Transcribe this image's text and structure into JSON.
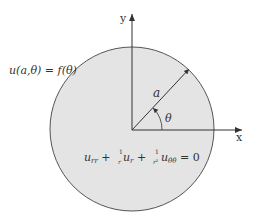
{
  "diagram": {
    "boundary_condition": "u(a,θ) = f(θ)",
    "equation": {
      "t1": "u",
      "t1_sub": "rr",
      "plus1": " + ",
      "frac1_num": "1",
      "frac1_den": "r",
      "t2": "u",
      "t2_sub": "r",
      "plus2": " + ",
      "frac2_num": "1",
      "frac2_den": "r²",
      "t3": "u",
      "t3_sub": "θθ",
      "rhs": " = 0"
    },
    "x_axis_label": "x",
    "y_axis_label": "y",
    "radius_label": "a",
    "angle_label": "θ",
    "colors": {
      "disk_fill": "#e4e4e4",
      "stroke": "#444444"
    }
  }
}
